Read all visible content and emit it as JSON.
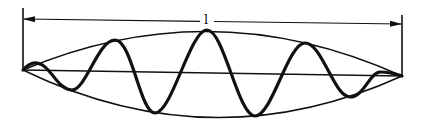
{
  "diagram": {
    "dimension_label": "l",
    "elements": [
      {
        "name": "left-boundary",
        "type": "vertical-line"
      },
      {
        "name": "right-boundary",
        "type": "vertical-line"
      },
      {
        "name": "length-dimension",
        "type": "double-arrow",
        "label": "l"
      },
      {
        "name": "axis",
        "type": "line"
      },
      {
        "name": "envelope-upper",
        "type": "curve"
      },
      {
        "name": "envelope-lower",
        "type": "curve"
      },
      {
        "name": "wave",
        "type": "oscillating-curve"
      }
    ],
    "colors": {
      "stroke": "#111111",
      "background": "#ffffff"
    }
  }
}
